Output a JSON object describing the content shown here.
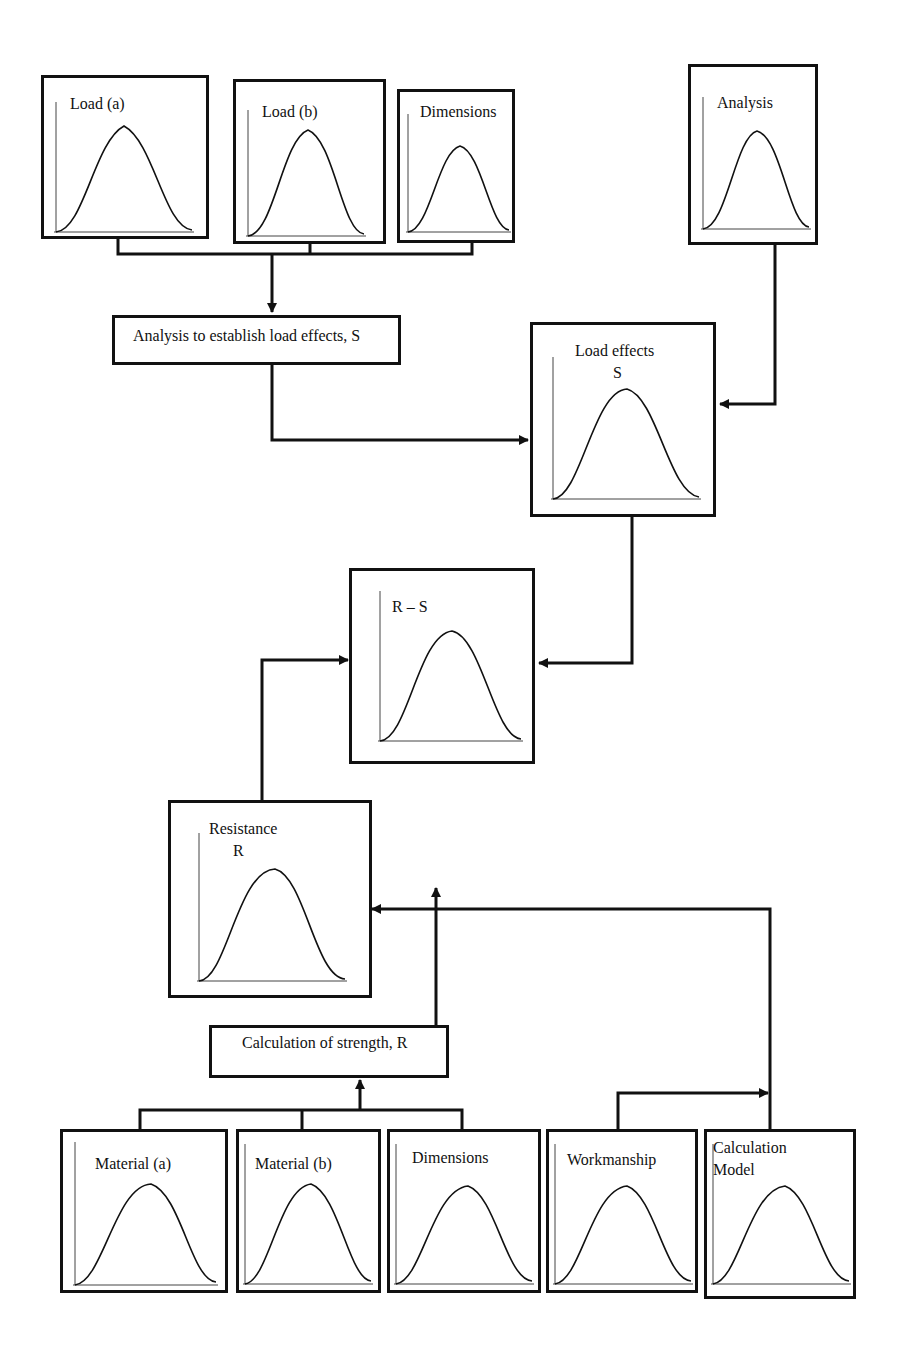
{
  "diagram": {
    "distribution_boxes": {
      "load_a": {
        "label": "Load (a)"
      },
      "load_b": {
        "label": "Load (b)"
      },
      "load_dimensions": {
        "label": "Dimensions"
      },
      "analysis": {
        "label": "Analysis"
      },
      "load_effects": {
        "label_line1": "Load effects",
        "label_line2": "S"
      },
      "r_minus_s": {
        "label": "R – S"
      },
      "resistance": {
        "label_line1": "Resistance",
        "label_line2": "R"
      },
      "material_a": {
        "label": "Material (a)"
      },
      "material_b": {
        "label": "Material (b)"
      },
      "resistance_dimensions": {
        "label": "Dimensions"
      },
      "workmanship": {
        "label": "Workmanship"
      },
      "calculation_model": {
        "label_line1": "Calculation",
        "label_line2": "Model"
      }
    },
    "process_boxes": {
      "load_analysis": {
        "label": "Analysis to establish load effects, S"
      },
      "strength_calculation": {
        "label": "Calculation of strength, R"
      }
    },
    "icons": {
      "distribution_curve": "bell-curve-icon",
      "arrow": "arrowhead-icon"
    },
    "colors": {
      "line": "#111111",
      "background": "#ffffff"
    }
  }
}
